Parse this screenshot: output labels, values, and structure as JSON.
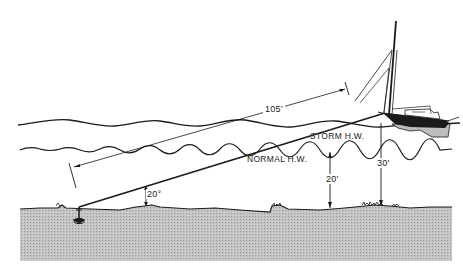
{
  "diagram": {
    "labels": {
      "rode_length": "105'",
      "storm_hw": "STORM H.W.",
      "normal_hw": "NORMAL H.W.",
      "normal_depth": "20'",
      "storm_depth": "30'",
      "rode_angle": "20°"
    },
    "colors": {
      "ink": "#1a1a1a",
      "seabed": "#bdbdbd",
      "background": "#ffffff"
    }
  }
}
